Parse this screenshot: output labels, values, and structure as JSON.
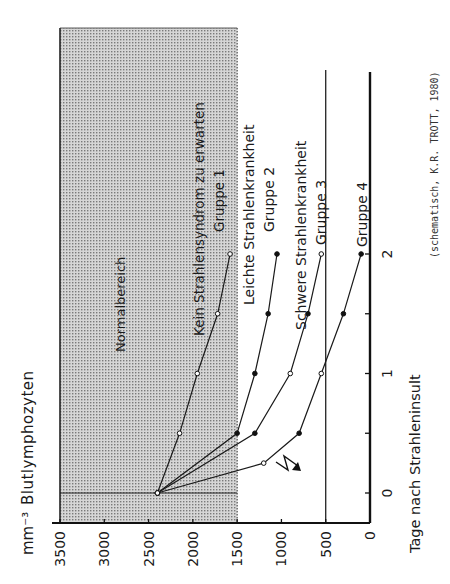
{
  "chart_data": {
    "type": "line",
    "orientation": "rotated-90-ccw",
    "ylabel": "Blutlymphozyten",
    "yunit": "mm-3",
    "xlabel": "Tage nach Strahleninsult",
    "source_note": "(schematisch, K.R. TROTT, 1980)",
    "y_ticks": [
      0,
      500,
      1000,
      1500,
      2000,
      2500,
      3000,
      3500
    ],
    "x_ticks": [
      0,
      1,
      2
    ],
    "x_minor_ticks": [
      0.5,
      1.5
    ],
    "ylim": [
      0,
      3500
    ],
    "xlim": [
      0,
      2.4
    ],
    "normal_range": {
      "label": "Normalbereich",
      "from": 1500,
      "to": 3500
    },
    "reference_line": 500,
    "lightning_marker_day": 0,
    "series": [
      {
        "name": "Gruppe 1",
        "description": "Kein Strahlensyndrom zu erwarten",
        "marker": "open",
        "x": [
          0,
          0.5,
          1,
          1.5,
          2
        ],
        "values": [
          2400,
          2150,
          1950,
          1720,
          1580
        ]
      },
      {
        "name": "Gruppe 2",
        "description": "Leichte Strahlenkrankheit",
        "marker": "filled",
        "x": [
          0,
          0.5,
          1,
          1.5,
          2
        ],
        "values": [
          2400,
          1500,
          1300,
          1150,
          1050
        ]
      },
      {
        "name": "Gruppe 3",
        "description": "Schwere Strahlenkrankheit",
        "marker": "mixed",
        "x": [
          0,
          0.5,
          1,
          1.5,
          2
        ],
        "values": [
          2400,
          1300,
          900,
          700,
          550
        ]
      },
      {
        "name": "Gruppe 4",
        "description": "",
        "marker": "mixed",
        "x": [
          0,
          0.25,
          0.5,
          1,
          1.5,
          2
        ],
        "values": [
          2400,
          1200,
          800,
          550,
          300,
          100
        ]
      }
    ]
  },
  "labels": {
    "unit": "mm⁻³",
    "ylabel": "Blutlymphozyten",
    "normal": "Normalbereich",
    "g1_desc": "Kein Strahlensyndrom zu erwarten",
    "g1_name": "Gruppe 1",
    "g2_desc": "Leichte Strahlenkrankheit",
    "g2_name": "Gruppe 2",
    "g3_desc": "Schwere Strahlenkrankheit",
    "g3_name": "Gruppe 3",
    "g4_name": "Gruppe 4",
    "xlabel": "Tage nach Strahleninsult",
    "source": "(schematisch, K.R. TROTT, 1980)"
  }
}
